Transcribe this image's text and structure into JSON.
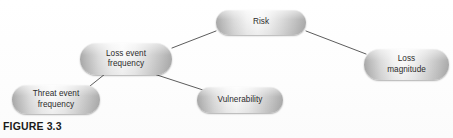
{
  "figure": {
    "caption": "FIGURE 3.3",
    "background_color": "#ffffff",
    "node_text_color": "#2b2b2b",
    "edge_color": "#4a4a4a",
    "node_gradient_light": "#fafafa",
    "node_gradient_dark": "#a9a9a9"
  },
  "diagram": {
    "type": "tree",
    "nodes": [
      {
        "id": "risk",
        "label": "Risk",
        "x": 216,
        "y": 10,
        "width": 90,
        "height": 25,
        "level": 0
      },
      {
        "id": "loss-event-frequency",
        "label": "Loss event\nfrequency",
        "x": 80,
        "y": 43,
        "width": 92,
        "height": 32,
        "level": 1
      },
      {
        "id": "loss-magnitude",
        "label": "Loss\nmagnitude",
        "x": 364,
        "y": 49,
        "width": 85,
        "height": 31,
        "level": 1
      },
      {
        "id": "threat-event-frequency",
        "label": "Threat event\nfrequency",
        "x": 12,
        "y": 85,
        "width": 88,
        "height": 29,
        "level": 2
      },
      {
        "id": "vulnerability",
        "label": "Vulnerability",
        "x": 197,
        "y": 87,
        "width": 86,
        "height": 26,
        "level": 2
      }
    ],
    "edges": [
      {
        "id": "risk-to-lef",
        "from": "risk",
        "to": "loss-event-frequency",
        "x1": 216,
        "y1": 31,
        "x2": 172,
        "y2": 48
      },
      {
        "id": "risk-to-lm",
        "from": "risk",
        "to": "loss-magnitude",
        "x1": 306,
        "y1": 31,
        "x2": 366,
        "y2": 54
      },
      {
        "id": "lef-to-tef",
        "from": "loss-event-frequency",
        "to": "threat-event-frequency",
        "x1": 105,
        "y1": 74,
        "x2": 90,
        "y2": 86
      },
      {
        "id": "lef-to-vuln",
        "from": "loss-event-frequency",
        "to": "vulnerability",
        "x1": 154,
        "y1": 74,
        "x2": 203,
        "y2": 90
      }
    ]
  }
}
